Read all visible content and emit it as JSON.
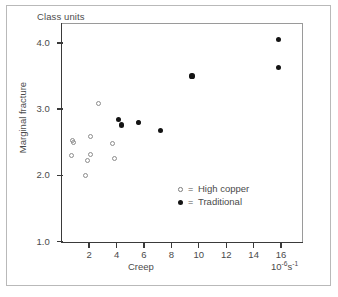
{
  "figure": {
    "title": "Class units"
  },
  "chart_data": {
    "type": "scatter",
    "title": "Class units",
    "xlabel": "Creep",
    "ylabel": "Marginal fracture",
    "x_units": "10",
    "x_units_exp1": "-6",
    "x_units_base2": "s",
    "x_units_exp2": "-1",
    "xlim": [
      0,
      17.6
    ],
    "ylim": [
      1.0,
      4.3
    ],
    "xticks": [
      2,
      4,
      6,
      8,
      10,
      12,
      14,
      16
    ],
    "xtick_labels": [
      "2",
      "4",
      "6",
      "8",
      "10",
      "12",
      "14",
      "16"
    ],
    "yticks": [
      1.0,
      2.0,
      3.0,
      4.0
    ],
    "ytick_labels": [
      "1.0",
      "2.0",
      "3.0",
      "4.0"
    ],
    "grid": false,
    "legend_position": "center-right-inside",
    "series": [
      {
        "name": "High copper",
        "marker": "open-circle",
        "color": "#8c8c8c",
        "points": [
          {
            "x": 0.8,
            "y": 2.53
          },
          {
            "x": 0.88,
            "y": 2.49
          },
          {
            "x": 0.75,
            "y": 2.3
          },
          {
            "x": 1.7,
            "y": 2.0
          },
          {
            "x": 1.85,
            "y": 2.22
          },
          {
            "x": 2.1,
            "y": 2.58
          },
          {
            "x": 2.1,
            "y": 2.32
          },
          {
            "x": 2.7,
            "y": 3.08
          },
          {
            "x": 3.7,
            "y": 2.48
          },
          {
            "x": 3.85,
            "y": 2.25
          },
          {
            "x": 5.6,
            "y": 2.8
          }
        ]
      },
      {
        "name": "Traditional",
        "marker": "filled-circle",
        "color": "#141414",
        "points": [
          {
            "x": 4.15,
            "y": 2.84
          },
          {
            "x": 4.35,
            "y": 2.76
          },
          {
            "x": 5.6,
            "y": 2.8
          },
          {
            "x": 7.2,
            "y": 2.68
          },
          {
            "x": 9.5,
            "y": 3.5
          },
          {
            "x": 15.8,
            "y": 4.05
          },
          {
            "x": 15.8,
            "y": 3.63
          }
        ]
      }
    ],
    "legend": [
      {
        "marker": "open-circle",
        "eq": "=",
        "label": "High copper"
      },
      {
        "marker": "filled-circle",
        "eq": "=",
        "label": "Traditional"
      }
    ]
  }
}
